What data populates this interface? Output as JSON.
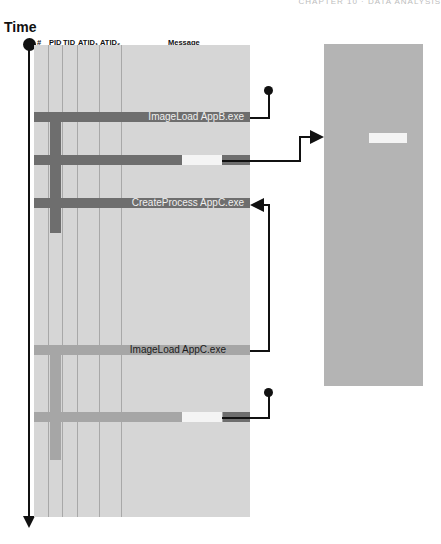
{
  "page_header": "CHAPTER 10 · DATA ANALYSIS",
  "timeline": {
    "label": "Time"
  },
  "table": {
    "columns": [
      "#",
      "PID",
      "TID",
      "ATID₁",
      "ATID₂",
      "Message"
    ]
  },
  "events": [
    {
      "message": "ImageLoad AppB.exe",
      "shade": "dark"
    },
    {
      "message": "",
      "shade": "dark",
      "highlight": true
    },
    {
      "message": "CreateProcess AppC.exe",
      "shade": "dark"
    },
    {
      "message": "ImageLoad AppC.exe",
      "shade": "medium"
    },
    {
      "message": "",
      "shade": "medium",
      "highlight": true
    }
  ],
  "colors": {
    "table_bg": "#d6d6d6",
    "dark_row": "#6e6e6e",
    "medium_row": "#a6a6a6",
    "highlight": "#f4f4f4",
    "right_panel": "#b4b4b4",
    "line": "#111111"
  }
}
